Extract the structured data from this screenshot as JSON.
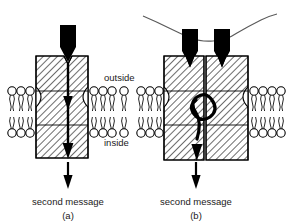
{
  "figure": {
    "background_color": "#ffffff",
    "ink_color": "#000000",
    "width": 288,
    "height": 223
  },
  "membrane_labels": {
    "outside": "outside",
    "inside": "inside"
  },
  "panels": [
    {
      "id": "a",
      "letter": "(a)",
      "output_label": "second message",
      "receptor_count": 1,
      "ligand_count": 1,
      "ligand_shape": "black-pentagon-arrowhead",
      "signal_path": "straight-vertical-arrow",
      "cross_linked": false,
      "protein_fill": "diagonal-hatch"
    },
    {
      "id": "b",
      "letter": "(b)",
      "output_label": "second message",
      "receptor_count": 2,
      "ligand_count": 2,
      "ligand_shape": "black-pentagon-arrowhead",
      "signal_path": "s-curve-arrow",
      "cross_linked": true,
      "cross_link_shape": "wavy-bridging-line",
      "protein_fill": "diagonal-hatch"
    }
  ],
  "legend_icons": {
    "lipid_head": "lipid-head-circle-icon",
    "lipid_tail": "lipid-tail-wavy-icon",
    "ligand": "ligand-arrowhead-icon",
    "signal_arrow": "signal-arrow-icon",
    "crosslink": "crosslink-wavy-line-icon"
  },
  "colors": {
    "ink": "#000000",
    "hatch": "#111111",
    "lipid_stroke": "#1a1a1a",
    "background": "#ffffff",
    "crosslink": "#555555"
  }
}
